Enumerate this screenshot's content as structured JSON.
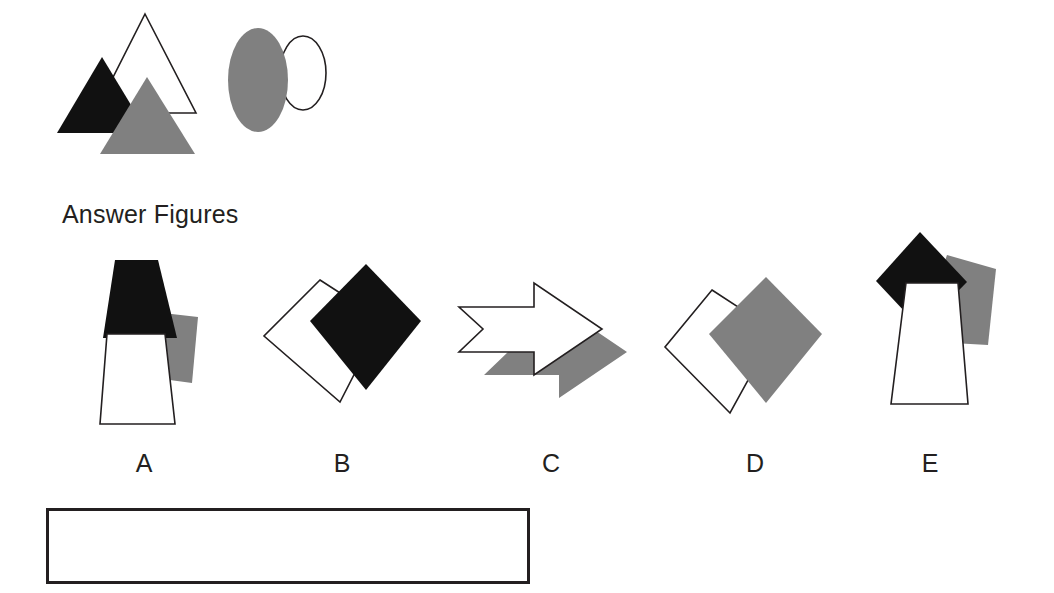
{
  "page": {
    "background_color": "#ffffff",
    "ink_color": "#231f20",
    "fill_gray": "#808080",
    "fill_black": "#111111",
    "fill_white": "#ffffff"
  },
  "question_figure": {
    "name": "question-figure",
    "shapes": [
      {
        "id": "white-triangle",
        "type": "triangle",
        "fill": "white",
        "outline": true,
        "points": "145,14 196,113 95,113"
      },
      {
        "id": "black-triangle",
        "type": "triangle",
        "fill": "black",
        "outline": false,
        "points": "102,57 148,133 57,133"
      },
      {
        "id": "gray-triangle",
        "type": "triangle",
        "fill": "gray",
        "outline": false,
        "points": "147,77 195,154 100,154"
      },
      {
        "id": "white-ellipse",
        "type": "ellipse",
        "fill": "white",
        "outline": true,
        "cx": 303,
        "cy": 73,
        "rx": 23,
        "ry": 37
      },
      {
        "id": "gray-ellipse",
        "type": "ellipse",
        "fill": "gray",
        "outline": false,
        "cx": 258,
        "cy": 80,
        "rx": 30,
        "ry": 52
      }
    ]
  },
  "answer_section": {
    "heading": "Answer Figures",
    "options": [
      {
        "key": "A",
        "label": "A",
        "name": "answer-option-a",
        "shapes": [
          {
            "id": "a-gray-trapezoid",
            "type": "polygon",
            "fill": "gray",
            "outline": false,
            "points": "163,313 198,317 192,383 155,378"
          },
          {
            "id": "a-black-trapezoid",
            "type": "polygon",
            "fill": "black",
            "outline": false,
            "points": "115,260 158,260 177,338 103,338"
          },
          {
            "id": "a-white-trapezoid",
            "type": "polygon",
            "fill": "white",
            "outline": true,
            "points": "107,334 165,334 175,424 100,424"
          }
        ]
      },
      {
        "key": "B",
        "label": "B",
        "name": "answer-option-b",
        "shapes": [
          {
            "id": "b-white-square",
            "type": "polygon",
            "fill": "white",
            "outline": true,
            "points": "320,280 382,320 340,402 264,336"
          },
          {
            "id": "b-black-diamond",
            "type": "polygon",
            "fill": "black",
            "outline": false,
            "points": "366,264 421,321 366,390 310,321"
          }
        ]
      },
      {
        "key": "C",
        "label": "C",
        "name": "answer-option-c",
        "shapes": [
          {
            "id": "c-gray-arrow",
            "type": "polygon",
            "fill": "gray",
            "outline": false,
            "points": "484,330 559,330 559,306 627,352 559,398 559,375 484,375 508,352"
          },
          {
            "id": "c-white-arrow",
            "type": "polygon",
            "fill": "white",
            "outline": true,
            "points": "459,307 534,307 534,283 602,329 534,375 534,352 459,352 483,329"
          }
        ]
      },
      {
        "key": "D",
        "label": "D",
        "name": "answer-option-d",
        "shapes": [
          {
            "id": "d-white-square",
            "type": "polygon",
            "fill": "white",
            "outline": true,
            "points": "712,290 775,331 730,413 665,347"
          },
          {
            "id": "d-gray-diamond",
            "type": "polygon",
            "fill": "gray",
            "outline": false,
            "points": "766,277 822,334 766,403 709,334"
          }
        ]
      },
      {
        "key": "E",
        "label": "E",
        "name": "answer-option-e",
        "shapes": [
          {
            "id": "e-gray-trapezoid",
            "type": "polygon",
            "fill": "gray",
            "outline": false,
            "points": "947,255 996,269 988,345 917,341"
          },
          {
            "id": "e-black-diamond",
            "type": "polygon",
            "fill": "black",
            "outline": false,
            "points": "920,232 967,282 921,329 876,281"
          },
          {
            "id": "e-white-trapezoid",
            "type": "polygon",
            "fill": "white",
            "outline": true,
            "points": "906,283 958,283 968,404 891,404"
          }
        ]
      }
    ]
  },
  "answer_box": {
    "name": "answer-response-box",
    "value": "",
    "placeholder": ""
  }
}
